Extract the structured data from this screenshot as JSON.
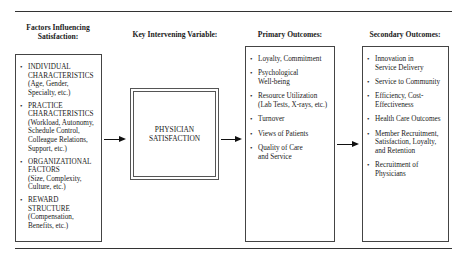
{
  "headers": {
    "factors": "Factors Influencing Satisfaction:",
    "factors_line1": "Factors  Influencing",
    "factors_line2": "Satisfaction:",
    "key": "Key Intervening Variable:",
    "primary": "Primary  Outcomes:",
    "secondary": "Secondary Outcomes:"
  },
  "factors": [
    {
      "title": "INDIVIDUAL CHARACTERISTICS",
      "detail": "(Age, Gender, Specialty, etc.)"
    },
    {
      "title": "PRACTICE CHARACTERISTICS",
      "detail": "(Workload, Autonomy, Schedule Control, Colleague Relations, Support, etc.)"
    },
    {
      "title": "ORGANIZATIONAL FACTORS",
      "detail": "(Size, Complexity, Culture, etc.)"
    },
    {
      "title": "REWARD STRUCTURE",
      "detail": "(Compensation, Benefits, etc.)"
    }
  ],
  "key_variable": {
    "line1": "PHYSICIAN",
    "line2": "SATISFACTION"
  },
  "primary_outcomes": [
    "Loyalty, Commitment",
    "Psychological Well-being",
    "Resource Utilization (Lab Tests, X-rays, etc.)",
    "Turnover",
    "Views of Patients",
    "Quality of Care and Service"
  ],
  "secondary_outcomes": [
    "Innovation in Service Delivery",
    "Service to Community",
    "Efficiency, Cost-Effectiveness",
    "Health Care Outcomes",
    "Member Recruitment, Satisfaction, Loyalty, and Retention",
    "Recruitment of Physicians"
  ]
}
